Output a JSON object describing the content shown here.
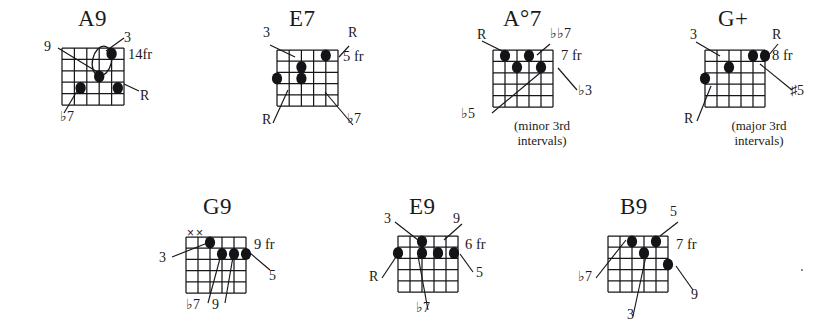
{
  "page": {
    "type": "guitar-chord-diagram-sheet",
    "rows": 2,
    "grid": {
      "strings": 6,
      "frets": 5
    }
  },
  "chords": [
    {
      "id": "a9",
      "name": "A9",
      "fret_marker": "14fr",
      "row": 1,
      "open_marks": "",
      "labels": [
        {
          "key": "three",
          "text": "3"
        },
        {
          "key": "nine",
          "text": "9"
        },
        {
          "key": "root",
          "text": "R"
        },
        {
          "key": "flat7",
          "text": "♭7"
        }
      ],
      "note_text": ""
    },
    {
      "id": "e7",
      "name": "E7",
      "fret_marker": "5 fr",
      "row": 1,
      "open_marks": "",
      "labels": [
        {
          "key": "three",
          "text": "3"
        },
        {
          "key": "rootTop",
          "text": "R"
        },
        {
          "key": "rootBot",
          "text": "R"
        },
        {
          "key": "flat7",
          "text": "♭7"
        }
      ],
      "note_text": ""
    },
    {
      "id": "adim7",
      "name": "A°7",
      "fret_marker": "7 fr",
      "row": 1,
      "open_marks": "",
      "labels": [
        {
          "key": "root",
          "text": "R"
        },
        {
          "key": "dblflat7",
          "text": "♭♭7"
        },
        {
          "key": "flat3",
          "text": "♭3"
        },
        {
          "key": "flat5",
          "text": "♭5"
        }
      ],
      "note_text": "(minor 3rd\nintervals)"
    },
    {
      "id": "gaug",
      "name": "G+",
      "fret_marker": "8 fr",
      "row": 1,
      "open_marks": "",
      "labels": [
        {
          "key": "three",
          "text": "3"
        },
        {
          "key": "rootTop",
          "text": "R"
        },
        {
          "key": "sharp5",
          "text": "♯5"
        },
        {
          "key": "rootBot",
          "text": "R"
        }
      ],
      "note_text": "(major 3rd\nintervals)"
    },
    {
      "id": "g9",
      "name": "G9",
      "fret_marker": "9 fr",
      "row": 2,
      "open_marks": "××",
      "labels": [
        {
          "key": "three",
          "text": "3"
        },
        {
          "key": "five",
          "text": "5"
        },
        {
          "key": "flat7",
          "text": "♭7"
        },
        {
          "key": "nine",
          "text": "9"
        }
      ],
      "note_text": ""
    },
    {
      "id": "e9",
      "name": "E9",
      "fret_marker": "6 fr",
      "row": 2,
      "open_marks": "",
      "labels": [
        {
          "key": "three",
          "text": "3"
        },
        {
          "key": "nine",
          "text": "9"
        },
        {
          "key": "five",
          "text": "5"
        },
        {
          "key": "root",
          "text": "R"
        },
        {
          "key": "flat7",
          "text": "♭7"
        }
      ],
      "note_text": ""
    },
    {
      "id": "b9",
      "name": "B9",
      "fret_marker": "7 fr",
      "row": 2,
      "open_marks": "",
      "labels": [
        {
          "key": "five",
          "text": "5"
        },
        {
          "key": "nine",
          "text": "9"
        },
        {
          "key": "flat7",
          "text": "♭7"
        },
        {
          "key": "three",
          "text": "3"
        }
      ],
      "note_text": ""
    }
  ]
}
